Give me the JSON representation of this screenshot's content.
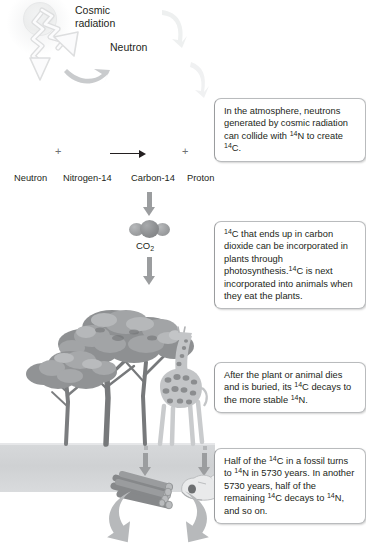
{
  "diagram": {
    "background_color": "#ffffff",
    "ground_color": "#d2d4d6",
    "arrow_color": "#9b9d9f",
    "text_color": "#231f20"
  },
  "labels": {
    "cosmic_radiation": "Cosmic\nradiation",
    "cosmic_radiation_line1": "Cosmic",
    "cosmic_radiation_line2": "radiation",
    "neutron_incoming": "Neutron",
    "co2": "CO",
    "co2_subscript": "2"
  },
  "equation": {
    "plus_left": "+",
    "plus_right": "+",
    "arrow": "→",
    "terms": [
      {
        "name": "reactant-neutron",
        "label": "Neutron"
      },
      {
        "name": "reactant-nitrogen-14",
        "label": "Nitrogen-14"
      },
      {
        "name": "product-carbon-14",
        "label": "Carbon-14"
      },
      {
        "name": "product-proton",
        "label": "Proton"
      }
    ]
  },
  "callouts": [
    {
      "id": "atmosphere",
      "segments": [
        {
          "t": "In the atmosphere, "
        },
        {
          "t": "neutrons generated "
        },
        {
          "t": "by cosmic radiation "
        },
        {
          "t": "can collide with "
        },
        {
          "sup": "14"
        },
        {
          "t": "N "
        },
        {
          "t": "to create "
        },
        {
          "sup": "14"
        },
        {
          "t": "C."
        }
      ],
      "plain": "In the atmosphere, neutrons generated by cosmic radiation can collide with 14N to create 14C."
    },
    {
      "id": "photosynthesis",
      "segments": [
        {
          "sup": "14"
        },
        {
          "t": "C that ends up in "
        },
        {
          "t": "carbon dioxide can "
        },
        {
          "t": "be incorporated in "
        },
        {
          "t": "plants through "
        },
        {
          "t": "photosynthesis."
        },
        {
          "sup": "14"
        },
        {
          "t": "C "
        },
        {
          "t": "is next incorporated "
        },
        {
          "t": "into animals when "
        },
        {
          "t": "they eat the plants."
        }
      ],
      "plain": "14C that ends up in carbon dioxide can be incorporated in plants through photosynthesis. 14C is next incorporated into animals when they eat the plants."
    },
    {
      "id": "burial-decay",
      "segments": [
        {
          "t": "After the plant or "
        },
        {
          "t": "animal dies and "
        },
        {
          "t": "is buried, its "
        },
        {
          "sup": "14"
        },
        {
          "t": "C "
        },
        {
          "t": "decays to the "
        },
        {
          "t": "more stable "
        },
        {
          "sup": "14"
        },
        {
          "t": "N."
        }
      ],
      "plain": "After the plant or animal dies and is buried, its 14C decays to the more stable 14N."
    },
    {
      "id": "half-life",
      "segments": [
        {
          "t": "Half of the "
        },
        {
          "sup": "14"
        },
        {
          "t": "C in "
        },
        {
          "t": "a fossil turns to "
        },
        {
          "sup": "14"
        },
        {
          "t": "N in 5730 "
        },
        {
          "t": "years. In another "
        },
        {
          "t": "5730 years, half "
        },
        {
          "t": "of the remaining "
        },
        {
          "sup": "14"
        },
        {
          "t": "C decays to "
        },
        {
          "sup": "14"
        },
        {
          "t": "N, and so on."
        }
      ],
      "plain": "Half of the 14C in a fossil turns to 14N in 5730 years. In another 5730 years, half of the remaining 14C decays to 14N, and so on."
    }
  ],
  "scene": {
    "objects": [
      {
        "name": "sun",
        "kind": "sun"
      },
      {
        "name": "cosmic-ray-zigzag-arrow",
        "kind": "arrow"
      },
      {
        "name": "neutron-zigzag-arrow",
        "kind": "arrow"
      },
      {
        "name": "cycle-arrow-top-right",
        "kind": "arrow"
      },
      {
        "name": "cycle-arrow-right",
        "kind": "arrow"
      },
      {
        "name": "cycle-arrow-mid",
        "kind": "arrow"
      },
      {
        "name": "co2-molecule",
        "kind": "molecule"
      },
      {
        "name": "acacia-tree-large",
        "kind": "plant"
      },
      {
        "name": "acacia-tree-small",
        "kind": "plant"
      },
      {
        "name": "giraffe",
        "kind": "animal"
      },
      {
        "name": "buried-wood-logs",
        "kind": "fossil"
      },
      {
        "name": "buried-skull",
        "kind": "fossil"
      },
      {
        "name": "ground-layer",
        "kind": "terrain"
      },
      {
        "name": "decay-arrow-left",
        "kind": "arrow"
      },
      {
        "name": "decay-arrow-right",
        "kind": "arrow"
      }
    ]
  }
}
